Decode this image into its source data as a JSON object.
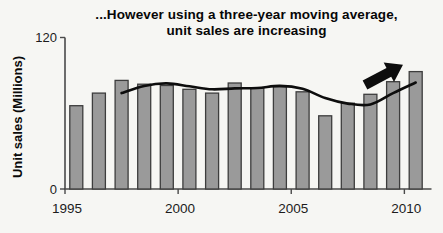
{
  "figure": {
    "title_line1": "...However using a three-year moving average,",
    "title_line2": "unit sales are increasing"
  },
  "chart_data": {
    "type": "bar",
    "title": "...However using a three-year moving average, unit sales are increasing",
    "xlabel": "",
    "ylabel": "Unit sales (Millions)",
    "categories": [
      "1995",
      "1996",
      "1997",
      "1998",
      "1999",
      "2000",
      "2001",
      "2002",
      "2003",
      "2004",
      "2005",
      "2006",
      "2007",
      "2008",
      "2009",
      "2010"
    ],
    "values": [
      66,
      76,
      86,
      83,
      82,
      79,
      76,
      84,
      80,
      81,
      77,
      58,
      68,
      75,
      85,
      93
    ],
    "overlay_line": {
      "name": "3-year moving average",
      "derivation": "trailing mean of current and previous two years",
      "window": 3
    },
    "ylim": [
      0,
      120
    ],
    "yticks": [
      120,
      0
    ],
    "xticks": [
      "1995",
      "2000",
      "2005",
      "2010"
    ],
    "grid": false,
    "legend": false,
    "annotation": {
      "type": "arrow",
      "direction": "up-right",
      "meaning": "increasing trend"
    }
  },
  "colors": {
    "background": "#f6f6f3",
    "bar_fill": "#9a9a9a",
    "bar_stroke": "#3d3d3d",
    "axis": "#4a4a4a",
    "tick_text": "#1c1c1c",
    "line": "#0d0d0d",
    "arrow": "#0d0d0d"
  }
}
